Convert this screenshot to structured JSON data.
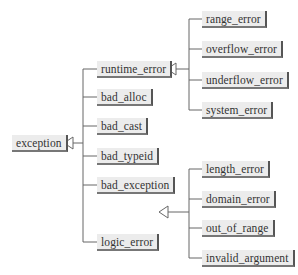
{
  "diagram": {
    "type": "class-hierarchy",
    "root": "exception",
    "nodes": {
      "exception": "exception",
      "runtime_error": "runtime_error",
      "bad_alloc": "bad_alloc",
      "bad_cast": "bad_cast",
      "bad_typeid": "bad_typeid",
      "bad_exception": "bad_exception",
      "logic_error": "logic_error",
      "range_error": "range_error",
      "overflow_error": "overflow_error",
      "underflow_error": "underflow_error",
      "system_error": "system_error",
      "length_error": "length_error",
      "domain_error": "domain_error",
      "out_of_range": "out_of_range",
      "invalid_argument": "invalid_argument"
    },
    "edges": [
      [
        "runtime_error",
        "exception"
      ],
      [
        "bad_alloc",
        "exception"
      ],
      [
        "bad_cast",
        "exception"
      ],
      [
        "bad_typeid",
        "exception"
      ],
      [
        "bad_exception",
        "exception"
      ],
      [
        "logic_error",
        "exception"
      ],
      [
        "range_error",
        "runtime_error"
      ],
      [
        "overflow_error",
        "runtime_error"
      ],
      [
        "underflow_error",
        "runtime_error"
      ],
      [
        "system_error",
        "runtime_error"
      ],
      [
        "length_error",
        "logic_error"
      ],
      [
        "domain_error",
        "logic_error"
      ],
      [
        "out_of_range",
        "logic_error"
      ],
      [
        "invalid_argument",
        "logic_error"
      ]
    ],
    "colors": {
      "line": "#555555",
      "box": "#ececec",
      "text": "#333333"
    }
  }
}
